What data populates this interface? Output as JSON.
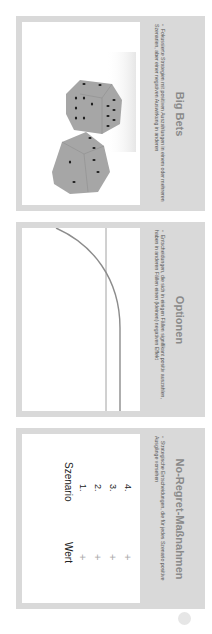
{
  "slides": [
    {
      "title": "Big Bets",
      "bullet": "Fokussierte Strategien mit positiven Auszahlungen in einem oder mehreren Szenarien, aber einer negativen Auswirkung in anderen",
      "illustration": "dice-image"
    },
    {
      "title": "Optionen",
      "bullet": "Entscheidungen, die sich in einigen Fällen signifikant positiv auszahlen, haben in anderen Fällen einen (kleinen) negativen Effekt",
      "illustration": "payoff-curve-chart"
    },
    {
      "title": "No-Regret-Maßnahmen",
      "bullet": "Strategische Entscheidungen, die für jedes Szenario positive Ausgänge vorsehen",
      "table": {
        "headers": [
          "Szenario",
          "Wert"
        ],
        "rows": [
          {
            "scenario": "1.",
            "value": "+"
          },
          {
            "scenario": "2.",
            "value": "+"
          },
          {
            "scenario": "3.",
            "value": "+"
          },
          {
            "scenario": "4.",
            "value": "+"
          }
        ]
      }
    }
  ],
  "colors": {
    "frame": "#d9d9d9",
    "caption_title": "#8a8a8a",
    "curve": "#8c8c8c",
    "die": "#a6a6a6",
    "pip": "#1a1a1a"
  }
}
